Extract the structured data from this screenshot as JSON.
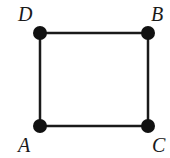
{
  "diagram": {
    "type": "square-graph",
    "vertices": [
      {
        "id": "D",
        "label": "D",
        "x": 40,
        "y": 33,
        "label_x": 18,
        "label_y": 21
      },
      {
        "id": "B",
        "label": "B",
        "x": 148,
        "y": 33,
        "label_x": 151,
        "label_y": 21
      },
      {
        "id": "A",
        "label": "A",
        "x": 40,
        "y": 126,
        "label_x": 18,
        "label_y": 152
      },
      {
        "id": "C",
        "label": "C",
        "x": 148,
        "y": 126,
        "label_x": 152,
        "label_y": 152
      }
    ],
    "edges": [
      {
        "from": "D",
        "to": "B"
      },
      {
        "from": "B",
        "to": "C"
      },
      {
        "from": "C",
        "to": "A"
      },
      {
        "from": "A",
        "to": "D"
      }
    ],
    "colors": {
      "stroke": "#1a1a1a",
      "vertex": "#111111"
    }
  }
}
